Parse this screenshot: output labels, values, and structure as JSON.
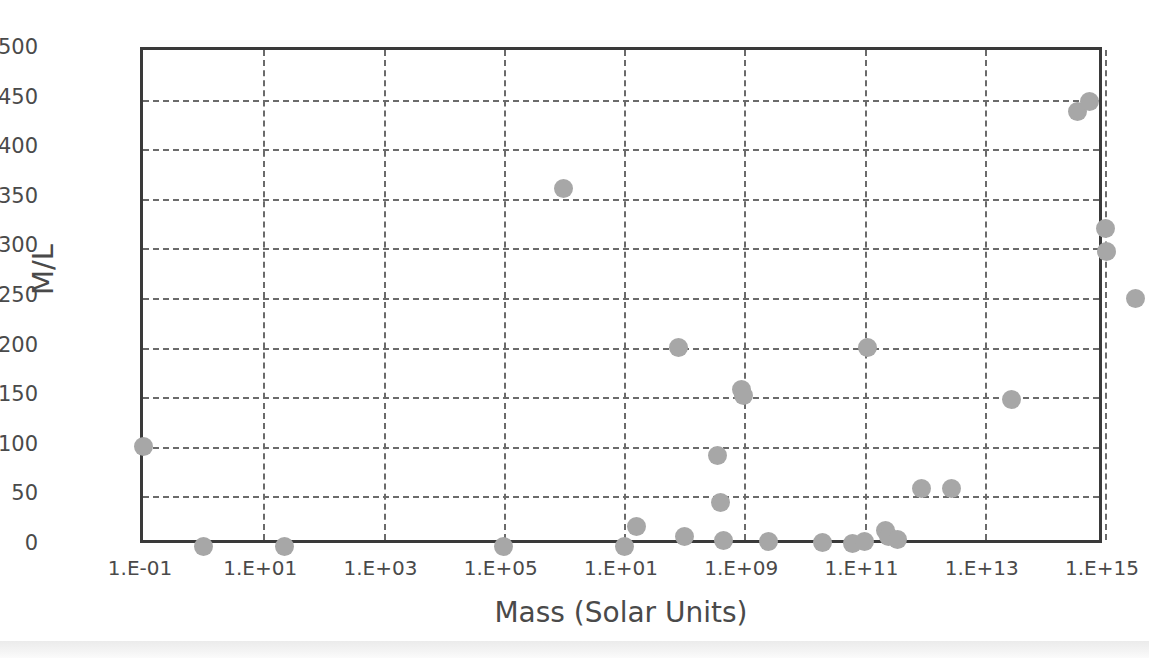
{
  "chart_data": {
    "type": "scatter",
    "title": "",
    "xlabel": "Mass (Solar Units)",
    "ylabel": "M/L",
    "grid": true,
    "legend": false,
    "marker_color": "#a7a7a7",
    "frame_color": "#3a3a3a",
    "gridline_color": "#6b6b6b",
    "ylim": [
      0,
      500
    ],
    "ytick_labels": [
      "500",
      "450",
      "400",
      "350",
      "300",
      "250",
      "200",
      "150",
      "100",
      "50",
      "0"
    ],
    "ytick_values": [
      500,
      450,
      400,
      350,
      300,
      250,
      200,
      150,
      100,
      50,
      0
    ],
    "xtick_labels": [
      "1.E-01",
      "1.E+01",
      "1.E+03",
      "1.E+05",
      "1.E+01",
      "1.E+09",
      "1.E+11",
      "1.E+13",
      "1.E+15"
    ],
    "xtick_exponents": [
      -1,
      1,
      3,
      5,
      7,
      9,
      11,
      13,
      15
    ],
    "xaxis_note": "fifth tick label is printed as 1.E+01 in the source figure (apparent typo for 1.E+07)",
    "points": [
      {
        "x_exp": -1.0,
        "y": 100
      },
      {
        "x_exp": 0.0,
        "y": 0
      },
      {
        "x_exp": 1.35,
        "y": 0
      },
      {
        "x_exp": 5.0,
        "y": 0
      },
      {
        "x_exp": 6.0,
        "y": 360
      },
      {
        "x_exp": 7.0,
        "y": 0
      },
      {
        "x_exp": 7.2,
        "y": 20
      },
      {
        "x_exp": 7.9,
        "y": 200
      },
      {
        "x_exp": 8.0,
        "y": 10
      },
      {
        "x_exp": 8.55,
        "y": 91
      },
      {
        "x_exp": 8.6,
        "y": 44
      },
      {
        "x_exp": 8.65,
        "y": 6
      },
      {
        "x_exp": 8.95,
        "y": 158
      },
      {
        "x_exp": 8.98,
        "y": 152
      },
      {
        "x_exp": 9.4,
        "y": 5
      },
      {
        "x_exp": 10.3,
        "y": 4
      },
      {
        "x_exp": 10.8,
        "y": 3
      },
      {
        "x_exp": 11.0,
        "y": 5
      },
      {
        "x_exp": 11.35,
        "y": 16
      },
      {
        "x_exp": 11.4,
        "y": 10
      },
      {
        "x_exp": 11.55,
        "y": 7
      },
      {
        "x_exp": 11.05,
        "y": 200
      },
      {
        "x_exp": 11.95,
        "y": 58
      },
      {
        "x_exp": 12.45,
        "y": 58
      },
      {
        "x_exp": 13.45,
        "y": 148
      },
      {
        "x_exp": 14.55,
        "y": 438
      },
      {
        "x_exp": 14.75,
        "y": 448
      },
      {
        "x_exp": 15.0,
        "y": 320
      },
      {
        "x_exp": 15.02,
        "y": 297
      },
      {
        "x_exp": 15.5,
        "y": 250
      }
    ]
  }
}
